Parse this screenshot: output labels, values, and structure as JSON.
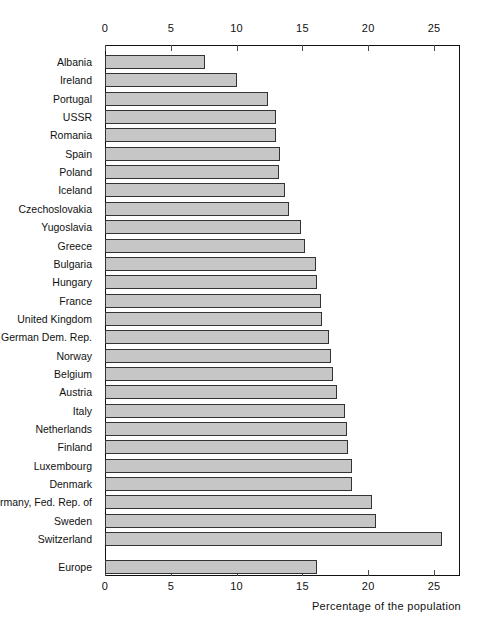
{
  "chart_data": {
    "type": "bar",
    "orientation": "horizontal",
    "title": "",
    "subtitle": "",
    "xlabel": "Percentage of the population",
    "ylabel": "",
    "xlim": [
      0,
      27
    ],
    "xticks": [
      0,
      5,
      10,
      15,
      20,
      25
    ],
    "xtick_labels": [
      "0",
      "5",
      "10",
      "15",
      "20",
      "25"
    ],
    "tick_labels_top": [
      "0",
      "5",
      "10",
      "15",
      "20",
      "25"
    ],
    "tick_labels_bottom": [
      "0",
      "5",
      "10",
      "15",
      "20",
      "25"
    ],
    "grid": false,
    "legend": null,
    "bar_fill_color": "#c6c6c6",
    "bar_edge_color": "#333333",
    "axis_color": "#111111",
    "background_color": "#ffffff",
    "categories": [
      "Albania",
      "Ireland",
      "Portugal",
      "USSR",
      "Romania",
      "Spain",
      "Poland",
      "Iceland",
      "Czechoslovakia",
      "Yugoslavia",
      "Greece",
      "Bulgaria",
      "Hungary",
      "France",
      "United Kingdom",
      "German Dem. Rep.",
      "Norway",
      "Belgium",
      "Austria",
      "Italy",
      "Netherlands",
      "Finland",
      "Luxembourg",
      "Denmark",
      "Germany, Fed. Rep. of",
      "Sweden",
      "Switzerland",
      "Europe"
    ],
    "values": [
      7.6,
      10.0,
      12.4,
      13.0,
      13.0,
      13.3,
      13.2,
      13.7,
      14.0,
      14.9,
      15.2,
      16.0,
      16.1,
      16.4,
      16.5,
      17.0,
      17.2,
      17.3,
      17.6,
      18.2,
      18.4,
      18.5,
      18.8,
      18.8,
      20.3,
      20.6,
      25.6,
      16.1
    ],
    "separated_last_category": "Europe",
    "units": "percent"
  },
  "axis": {
    "title_text": "Percentage of the population"
  }
}
